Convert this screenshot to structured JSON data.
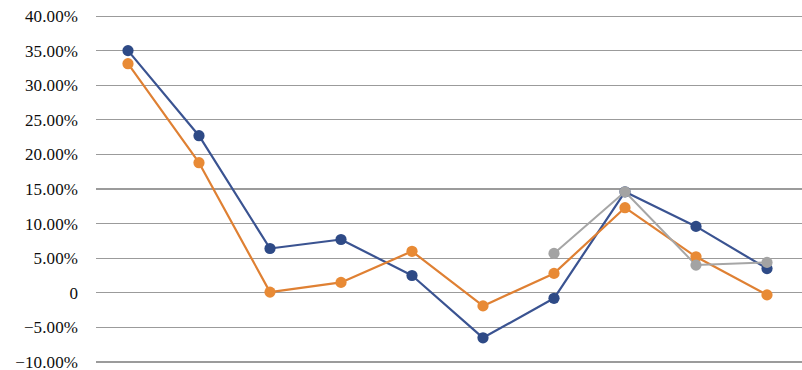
{
  "chart_data": {
    "type": "line",
    "title": "",
    "subtitle": "",
    "xlabel": "",
    "ylabel": "",
    "grid": "horizontal",
    "legend": "none",
    "ylim": [
      -10,
      40
    ],
    "ytick_values": [
      40,
      35,
      30,
      25,
      20,
      15,
      10,
      5,
      0,
      -5,
      -10
    ],
    "ytick_labels": [
      "40.00%",
      "35.00%",
      "30.00%",
      "25.00%",
      "20.00%",
      "15.00%",
      "10.00%",
      "5.00%",
      "0",
      "−5.00%",
      "−10.00%"
    ],
    "x": [
      1,
      2,
      3,
      4,
      5,
      6,
      7,
      8,
      9,
      10
    ],
    "xtick_labels": [],
    "series": [
      {
        "name": "Series 1",
        "color": "#3a5391",
        "marker_color": "#2e4a86",
        "values": [
          35.0,
          22.7,
          6.4,
          7.7,
          2.5,
          -6.5,
          -0.8,
          14.6,
          9.6,
          3.5
        ]
      },
      {
        "name": "Series 2",
        "color": "#df8033",
        "marker_color": "#e88a35",
        "values": [
          33.1,
          18.8,
          0.1,
          1.5,
          6.0,
          -1.9,
          2.8,
          12.3,
          5.2,
          -0.3
        ]
      },
      {
        "name": "Series 3",
        "color": "#a6a6a6",
        "marker_color": "#a3a3a3",
        "values": [
          null,
          null,
          null,
          null,
          null,
          null,
          5.7,
          14.6,
          4.0,
          4.4
        ]
      }
    ]
  },
  "axis": {
    "y_title": "",
    "x_title": ""
  }
}
